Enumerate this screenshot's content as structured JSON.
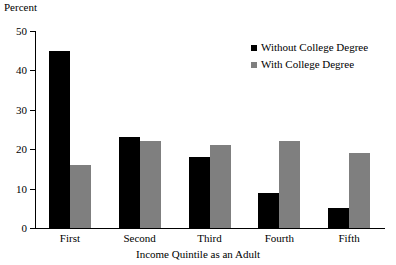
{
  "chart_data": {
    "type": "bar",
    "title": "",
    "xlabel": "Income Quintile as an Adult",
    "ylabel": "Percent",
    "categories": [
      "First",
      "Second",
      "Third",
      "Fourth",
      "Fifth"
    ],
    "series": [
      {
        "name": "Without College Degree",
        "values": [
          45,
          23,
          18,
          9,
          5
        ],
        "color": "#000000"
      },
      {
        "name": "With College Degree",
        "values": [
          16,
          22,
          21,
          22,
          19
        ],
        "color": "#7f7f7f"
      }
    ],
    "ylim": [
      0,
      50
    ],
    "yticks": [
      0,
      10,
      20,
      30,
      40,
      50
    ],
    "ytick_labels": [
      "0",
      "10",
      "20",
      "30",
      "40",
      "50"
    ],
    "grid": false,
    "legend_position": "top-right"
  },
  "legend": {
    "items": [
      {
        "label": "Without College Degree",
        "color": "#000000"
      },
      {
        "label": "With College Degree",
        "color": "#7f7f7f"
      }
    ]
  }
}
